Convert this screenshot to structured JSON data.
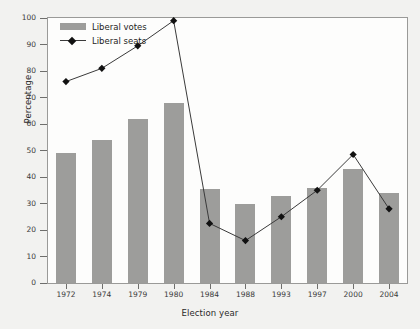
{
  "chart_data": {
    "type": "bar",
    "title": "",
    "subtitle": "",
    "xlabel": "Election year",
    "ylabel": "Percentage",
    "categories": [
      "1972",
      "1974",
      "1979",
      "1980",
      "1984",
      "1988",
      "1993",
      "1997",
      "2000",
      "2004"
    ],
    "ylim": [
      0,
      100
    ],
    "yticks": [
      0,
      10,
      20,
      30,
      40,
      50,
      60,
      70,
      80,
      90,
      100
    ],
    "grid": false,
    "legend_position": "top-left",
    "series": [
      {
        "name": "Liberal votes",
        "type": "bar",
        "color": "#9d9d9b",
        "values": [
          49,
          54,
          62,
          68,
          35.5,
          30,
          33,
          36,
          43,
          34
        ]
      },
      {
        "name": "Liberal seats",
        "type": "line",
        "color": "#3a3a3a",
        "marker": "diamond",
        "values": [
          76,
          81,
          89.5,
          99,
          22.5,
          16,
          25,
          35,
          48.5,
          28
        ]
      }
    ]
  },
  "legend": {
    "items": [
      {
        "label": "Liberal votes",
        "swatch": "bar-swatch"
      },
      {
        "label": "Liberal seats",
        "swatch": "line-diamond-swatch"
      }
    ]
  },
  "axes": {
    "x_label": "Election year",
    "y_label": "Percentage"
  }
}
